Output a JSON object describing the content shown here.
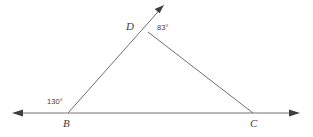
{
  "figure": {
    "type": "geometry-diagram",
    "background_color": "#ffffff",
    "stroke_color": "#6a6a6a",
    "text_color": "#3a3a3a",
    "width": 313,
    "height": 137
  },
  "vertices": [
    {
      "name": "B",
      "label": "B",
      "x": 68,
      "y": 113
    },
    {
      "name": "C",
      "label": "C",
      "x": 253,
      "y": 113
    },
    {
      "name": "D",
      "label": "D",
      "x": 148,
      "y": 32
    }
  ],
  "angles": [
    {
      "name": "angle-at-B",
      "label": "130°",
      "value": 130,
      "unit": "degrees",
      "x": 47,
      "y": 98
    },
    {
      "name": "angle-at-D",
      "label": "83°",
      "value": 83,
      "unit": "degrees",
      "x": 157,
      "y": 24
    }
  ],
  "segments": [
    {
      "name": "baseline-BC",
      "from": "left-arrow",
      "to": "right-arrow",
      "x1": 12,
      "y1": 113,
      "x2": 300,
      "y2": 113,
      "arrows": "both"
    },
    {
      "name": "ray-BD-extended",
      "from": "B",
      "to": "arrow-tip",
      "x1": 68,
      "y1": 113,
      "x2": 164,
      "y2": 5,
      "arrows": "end"
    },
    {
      "name": "segment-DC",
      "from": "D",
      "to": "C",
      "x1": 148,
      "y1": 32,
      "x2": 253,
      "y2": 113,
      "arrows": "none"
    }
  ],
  "arrowheads": [
    {
      "name": "baseline-left-arrowhead",
      "x": 12,
      "y": 113,
      "direction": "left"
    },
    {
      "name": "baseline-right-arrowhead",
      "x": 300,
      "y": 113,
      "direction": "right"
    },
    {
      "name": "ray-BD-arrowhead",
      "x": 164,
      "y": 5,
      "direction": "up-right"
    }
  ]
}
